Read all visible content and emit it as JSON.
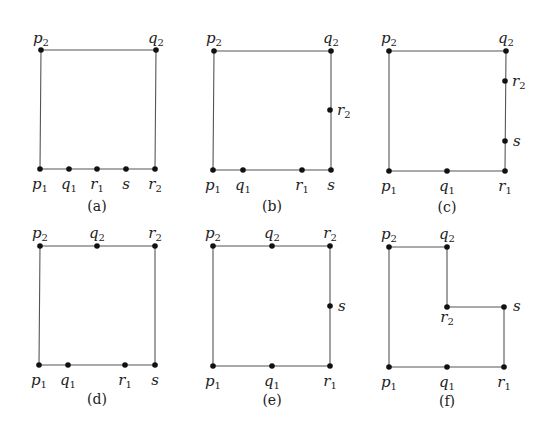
{
  "diagram": {
    "panels": [
      {
        "caption": "(a)",
        "polygon": [
          [
            41,
            50
          ],
          [
            156,
            50
          ],
          [
            155,
            169
          ],
          [
            40,
            169
          ]
        ],
        "points": [
          {
            "name": "p",
            "sub": "2",
            "x": 41,
            "y": 50,
            "lx": 41,
            "ly": 43,
            "anchor": "middle"
          },
          {
            "name": "q",
            "sub": "2",
            "x": 156,
            "y": 50,
            "lx": 156,
            "ly": 43,
            "anchor": "middle"
          },
          {
            "name": "p",
            "sub": "1",
            "x": 40,
            "y": 169,
            "lx": 40,
            "ly": 189,
            "anchor": "middle"
          },
          {
            "name": "q",
            "sub": "1",
            "x": 69,
            "y": 169,
            "lx": 69,
            "ly": 189,
            "anchor": "middle"
          },
          {
            "name": "r",
            "sub": "1",
            "x": 97,
            "y": 169,
            "lx": 97,
            "ly": 189,
            "anchor": "middle"
          },
          {
            "name": "s",
            "sub": "",
            "x": 126,
            "y": 169,
            "lx": 126,
            "ly": 189,
            "anchor": "middle"
          },
          {
            "name": "r",
            "sub": "2",
            "x": 155,
            "y": 169,
            "lx": 155,
            "ly": 189,
            "anchor": "middle"
          }
        ],
        "cap_x": 97,
        "cap_y": 211
      },
      {
        "caption": "(b)",
        "polygon": [
          [
            214,
            51
          ],
          [
            331,
            51
          ],
          [
            331,
            170
          ],
          [
            213,
            170
          ]
        ],
        "points": [
          {
            "name": "p",
            "sub": "2",
            "x": 214,
            "y": 51,
            "lx": 214,
            "ly": 43,
            "anchor": "middle"
          },
          {
            "name": "q",
            "sub": "2",
            "x": 331,
            "y": 51,
            "lx": 331,
            "ly": 43,
            "anchor": "middle"
          },
          {
            "name": "r",
            "sub": "2",
            "x": 330,
            "y": 110,
            "lx": 337,
            "ly": 115,
            "anchor": "start"
          },
          {
            "name": "p",
            "sub": "1",
            "x": 213,
            "y": 170,
            "lx": 213,
            "ly": 190,
            "anchor": "middle"
          },
          {
            "name": "q",
            "sub": "1",
            "x": 243,
            "y": 170,
            "lx": 243,
            "ly": 190,
            "anchor": "middle"
          },
          {
            "name": "r",
            "sub": "1",
            "x": 302,
            "y": 170,
            "lx": 302,
            "ly": 190,
            "anchor": "middle"
          },
          {
            "name": "s",
            "sub": "",
            "x": 331,
            "y": 170,
            "lx": 331,
            "ly": 190,
            "anchor": "middle"
          }
        ],
        "cap_x": 272,
        "cap_y": 211
      },
      {
        "caption": "(c)",
        "polygon": [
          [
            389,
            51
          ],
          [
            506,
            51
          ],
          [
            505,
            171
          ],
          [
            389,
            171
          ]
        ],
        "points": [
          {
            "name": "p",
            "sub": "2",
            "x": 389,
            "y": 51,
            "lx": 389,
            "ly": 43,
            "anchor": "middle"
          },
          {
            "name": "q",
            "sub": "2",
            "x": 506,
            "y": 51,
            "lx": 506,
            "ly": 43,
            "anchor": "middle"
          },
          {
            "name": "r",
            "sub": "2",
            "x": 505,
            "y": 81,
            "lx": 512,
            "ly": 86,
            "anchor": "start"
          },
          {
            "name": "s",
            "sub": "",
            "x": 505,
            "y": 141,
            "lx": 513,
            "ly": 146,
            "anchor": "start"
          },
          {
            "name": "p",
            "sub": "1",
            "x": 389,
            "y": 171,
            "lx": 389,
            "ly": 191,
            "anchor": "middle"
          },
          {
            "name": "q",
            "sub": "1",
            "x": 447,
            "y": 171,
            "lx": 447,
            "ly": 191,
            "anchor": "middle"
          },
          {
            "name": "r",
            "sub": "1",
            "x": 505,
            "y": 171,
            "lx": 505,
            "ly": 191,
            "anchor": "middle"
          }
        ],
        "cap_x": 447,
        "cap_y": 212
      },
      {
        "caption": "(d)",
        "polygon": [
          [
            40,
            246
          ],
          [
            155,
            246
          ],
          [
            155,
            365
          ],
          [
            39,
            365
          ]
        ],
        "points": [
          {
            "name": "p",
            "sub": "2",
            "x": 40,
            "y": 246,
            "lx": 40,
            "ly": 238,
            "anchor": "middle"
          },
          {
            "name": "q",
            "sub": "2",
            "x": 97,
            "y": 246,
            "lx": 97,
            "ly": 238,
            "anchor": "middle"
          },
          {
            "name": "r",
            "sub": "2",
            "x": 155,
            "y": 246,
            "lx": 155,
            "ly": 238,
            "anchor": "middle"
          },
          {
            "name": "p",
            "sub": "1",
            "x": 39,
            "y": 365,
            "lx": 39,
            "ly": 385,
            "anchor": "middle"
          },
          {
            "name": "q",
            "sub": "1",
            "x": 68,
            "y": 365,
            "lx": 68,
            "ly": 385,
            "anchor": "middle"
          },
          {
            "name": "r",
            "sub": "1",
            "x": 125,
            "y": 365,
            "lx": 125,
            "ly": 385,
            "anchor": "middle"
          },
          {
            "name": "s",
            "sub": "",
            "x": 155,
            "y": 365,
            "lx": 155,
            "ly": 385,
            "anchor": "middle"
          }
        ],
        "cap_x": 97,
        "cap_y": 404
      },
      {
        "caption": "(e)",
        "polygon": [
          [
            213,
            246
          ],
          [
            330,
            246
          ],
          [
            330,
            366
          ],
          [
            213,
            366
          ]
        ],
        "points": [
          {
            "name": "p",
            "sub": "2",
            "x": 213,
            "y": 246,
            "lx": 213,
            "ly": 238,
            "anchor": "middle"
          },
          {
            "name": "q",
            "sub": "2",
            "x": 272,
            "y": 246,
            "lx": 272,
            "ly": 238,
            "anchor": "middle"
          },
          {
            "name": "r",
            "sub": "2",
            "x": 330,
            "y": 246,
            "lx": 330,
            "ly": 238,
            "anchor": "middle"
          },
          {
            "name": "s",
            "sub": "",
            "x": 330,
            "y": 306,
            "lx": 338,
            "ly": 311,
            "anchor": "start"
          },
          {
            "name": "p",
            "sub": "1",
            "x": 213,
            "y": 366,
            "lx": 213,
            "ly": 386,
            "anchor": "middle"
          },
          {
            "name": "q",
            "sub": "1",
            "x": 272,
            "y": 366,
            "lx": 272,
            "ly": 386,
            "anchor": "middle"
          },
          {
            "name": "r",
            "sub": "1",
            "x": 330,
            "y": 366,
            "lx": 330,
            "ly": 386,
            "anchor": "middle"
          }
        ],
        "cap_x": 272,
        "cap_y": 405
      },
      {
        "caption": "(f)",
        "polygon": [
          [
            389,
            247
          ],
          [
            447,
            247
          ],
          [
            447,
            307
          ],
          [
            504,
            307
          ],
          [
            504,
            367
          ],
          [
            389,
            367
          ]
        ],
        "points": [
          {
            "name": "p",
            "sub": "2",
            "x": 389,
            "y": 247,
            "lx": 389,
            "ly": 239,
            "anchor": "middle"
          },
          {
            "name": "q",
            "sub": "2",
            "x": 447,
            "y": 247,
            "lx": 447,
            "ly": 239,
            "anchor": "middle"
          },
          {
            "name": "r",
            "sub": "2",
            "x": 447,
            "y": 307,
            "lx": 447,
            "ly": 322,
            "anchor": "middle"
          },
          {
            "name": "s",
            "sub": "",
            "x": 504,
            "y": 307,
            "lx": 513,
            "ly": 311,
            "anchor": "start"
          },
          {
            "name": "p",
            "sub": "1",
            "x": 389,
            "y": 367,
            "lx": 389,
            "ly": 387,
            "anchor": "middle"
          },
          {
            "name": "q",
            "sub": "1",
            "x": 447,
            "y": 367,
            "lx": 447,
            "ly": 387,
            "anchor": "middle"
          },
          {
            "name": "r",
            "sub": "1",
            "x": 504,
            "y": 367,
            "lx": 504,
            "ly": 387,
            "anchor": "middle"
          }
        ],
        "cap_x": 447,
        "cap_y": 406
      }
    ]
  }
}
